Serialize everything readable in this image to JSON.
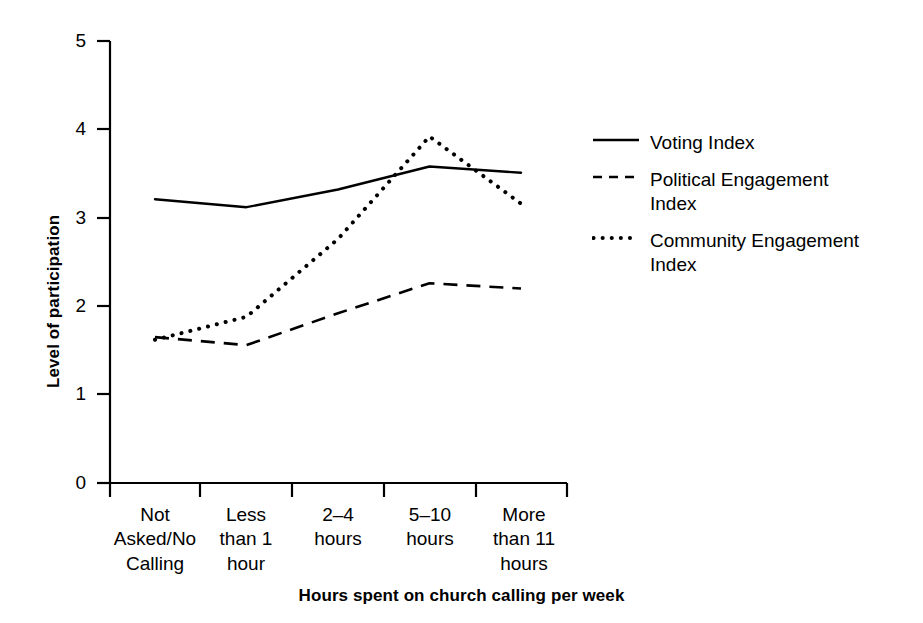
{
  "chart_data": {
    "type": "line",
    "title": "",
    "xlabel": "Hours spent on church calling per week",
    "ylabel": "Level of participation",
    "categories": [
      "Not\nAsked/No\nCalling",
      "Less\nthan 1\nhour",
      "2–4\nhours",
      "5–10\nhours",
      "More\nthan 11\nhours"
    ],
    "ylim": [
      0,
      5
    ],
    "yticks": [
      0,
      1,
      2,
      3,
      4,
      5
    ],
    "ytick_labels": [
      "0",
      "1",
      "2",
      "3",
      "4",
      "5"
    ],
    "grid": false,
    "legend_position": "right",
    "series": [
      {
        "name": "Voting Index",
        "style": "solid",
        "color": "#000000",
        "values": [
          3.21,
          3.12,
          3.32,
          3.58,
          3.51
        ]
      },
      {
        "name": "Political Engagement\nIndex",
        "style": "dashed",
        "color": "#000000",
        "values": [
          1.65,
          1.56,
          1.92,
          2.26,
          2.2
        ]
      },
      {
        "name": "Community Engagement\nIndex",
        "style": "dotted",
        "color": "#000000",
        "values": [
          1.62,
          1.88,
          2.76,
          3.92,
          3.16
        ]
      }
    ]
  },
  "axis": {
    "y_title": "Level of participation",
    "x_title": "Hours spent on church calling per week",
    "y_ticks": [
      "5",
      "4",
      "3",
      "2",
      "1",
      "0"
    ],
    "x_categories": [
      "Not\nAsked/No\nCalling",
      "Less\nthan 1\nhour",
      "2–4\nhours",
      "5–10\nhours",
      "More\nthan 11\nhours"
    ]
  },
  "legend": {
    "entries": [
      {
        "label": "Voting Index",
        "style": "solid"
      },
      {
        "label": "Political Engagement\nIndex",
        "style": "dashed"
      },
      {
        "label": "Community Engagement\nIndex",
        "style": "dotted"
      }
    ]
  },
  "colors": {
    "ink": "#000000",
    "background": "#ffffff"
  }
}
